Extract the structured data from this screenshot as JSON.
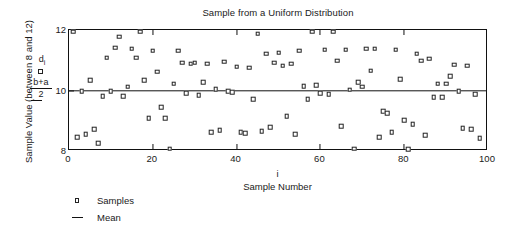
{
  "chart_data": {
    "type": "scatter",
    "title": "Sample from a Uniform Distribution",
    "xlabel": "Sample Number",
    "x_variable": "i",
    "ylabel": "Sample Value (between 8 and 12)",
    "xlim": [
      0,
      100
    ],
    "ylim": [
      8,
      12
    ],
    "grid": false,
    "legend_position": "below-left",
    "xticks": [
      0,
      20,
      40,
      60,
      80,
      100
    ],
    "yticks": [
      8,
      10,
      12
    ],
    "mean_value": 10,
    "annotations": [
      {
        "name": "d_i",
        "text": "d",
        "subscript": "i",
        "marker": "square"
      },
      {
        "name": "mean-formula",
        "numerator": "b+a",
        "denominator": "2",
        "marker": "line"
      }
    ],
    "series": [
      {
        "name": "Samples",
        "marker": "open-square",
        "color": "#222222",
        "points": [
          [
            1,
            11.95
          ],
          [
            2,
            8.45
          ],
          [
            3,
            9.98
          ],
          [
            4,
            8.55
          ],
          [
            5,
            10.35
          ],
          [
            6,
            8.72
          ],
          [
            7,
            8.25
          ],
          [
            8,
            9.82
          ],
          [
            9,
            11.08
          ],
          [
            10,
            9.98
          ],
          [
            11,
            11.42
          ],
          [
            12,
            11.78
          ],
          [
            13,
            9.82
          ],
          [
            14,
            10.12
          ],
          [
            15,
            11.38
          ],
          [
            16,
            11.08
          ],
          [
            17,
            11.95
          ],
          [
            18,
            10.35
          ],
          [
            19,
            9.08
          ],
          [
            20,
            11.32
          ],
          [
            21,
            10.62
          ],
          [
            22,
            9.45
          ],
          [
            23,
            9.08
          ],
          [
            24,
            8.08
          ],
          [
            25,
            10.22
          ],
          [
            26,
            11.32
          ],
          [
            27,
            10.92
          ],
          [
            28,
            9.92
          ],
          [
            29,
            10.88
          ],
          [
            30,
            10.92
          ],
          [
            31,
            9.85
          ],
          [
            32,
            10.28
          ],
          [
            33,
            10.88
          ],
          [
            34,
            8.62
          ],
          [
            35,
            10.05
          ],
          [
            36,
            8.68
          ],
          [
            37,
            10.95
          ],
          [
            38,
            9.98
          ],
          [
            39,
            9.95
          ],
          [
            40,
            10.78
          ],
          [
            41,
            8.62
          ],
          [
            42,
            8.58
          ],
          [
            43,
            10.75
          ],
          [
            44,
            9.72
          ],
          [
            45,
            11.88
          ],
          [
            46,
            8.65
          ],
          [
            47,
            11.22
          ],
          [
            48,
            8.78
          ],
          [
            49,
            10.92
          ],
          [
            50,
            11.25
          ],
          [
            51,
            10.82
          ],
          [
            52,
            9.15
          ],
          [
            53,
            10.88
          ],
          [
            54,
            8.55
          ],
          [
            55,
            11.32
          ],
          [
            56,
            10.15
          ],
          [
            57,
            9.72
          ],
          [
            58,
            11.95
          ],
          [
            59,
            10.18
          ],
          [
            60,
            9.92
          ],
          [
            61,
            11.35
          ],
          [
            62,
            9.88
          ],
          [
            63,
            11.95
          ],
          [
            64,
            10.98
          ],
          [
            65,
            8.82
          ],
          [
            66,
            11.35
          ],
          [
            67,
            10.02
          ],
          [
            68,
            8.08
          ],
          [
            69,
            10.28
          ],
          [
            70,
            10.12
          ],
          [
            71,
            11.38
          ],
          [
            72,
            10.65
          ],
          [
            73,
            11.38
          ],
          [
            74,
            8.45
          ],
          [
            75,
            9.32
          ],
          [
            76,
            9.25
          ],
          [
            77,
            8.62
          ],
          [
            78,
            11.35
          ],
          [
            79,
            10.38
          ],
          [
            80,
            9.02
          ],
          [
            81,
            8.05
          ],
          [
            82,
            8.88
          ],
          [
            83,
            11.22
          ],
          [
            84,
            10.98
          ],
          [
            85,
            8.52
          ],
          [
            86,
            11.05
          ],
          [
            87,
            9.78
          ],
          [
            88,
            10.22
          ],
          [
            89,
            9.78
          ],
          [
            90,
            10.22
          ],
          [
            91,
            10.48
          ],
          [
            92,
            10.85
          ],
          [
            93,
            9.98
          ],
          [
            94,
            8.75
          ],
          [
            95,
            10.82
          ],
          [
            96,
            8.72
          ],
          [
            97,
            9.88
          ],
          [
            98,
            8.42
          ]
        ]
      }
    ],
    "mean_line": {
      "name": "Mean",
      "value": 10,
      "color": "#111111"
    }
  },
  "legend": {
    "items": [
      {
        "label": "Samples",
        "swatch": "square-marker"
      },
      {
        "label": "Mean",
        "swatch": "line-marker"
      }
    ]
  }
}
